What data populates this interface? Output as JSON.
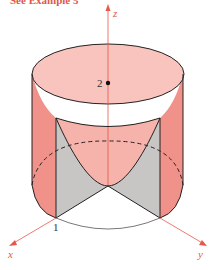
{
  "caption": "See Example 5",
  "axes": {
    "z_label": "z",
    "x_label": "x",
    "y_label": "y"
  },
  "labels": {
    "height_mark": "2",
    "radius_mark": "1"
  },
  "colors": {
    "cylinder_side": "#f0918a",
    "cylinder_top": "#f9c4bd",
    "paraboloid": "#f6b3ab",
    "cutout_gray": "#c8c5c5",
    "axis": "#e8574a",
    "outline": "#222222"
  }
}
